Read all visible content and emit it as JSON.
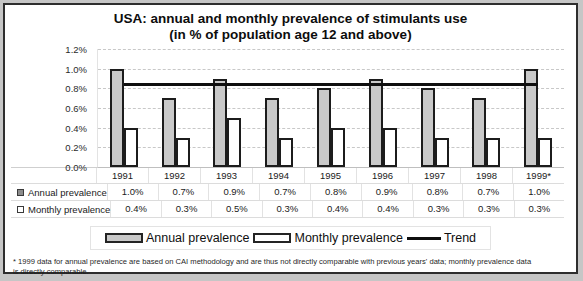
{
  "title": {
    "line1": "USA: annual and monthly prevalence of stimulants use",
    "line2": "(in % of population age 12 and above)"
  },
  "chart_data": {
    "type": "bar",
    "title": "USA: annual and monthly prevalence of stimulants use (in % of population age 12 and above)",
    "categories": [
      "1991",
      "1992",
      "1993",
      "1994",
      "1995",
      "1996",
      "1997",
      "1998",
      "1999*"
    ],
    "series": [
      {
        "name": "Annual prevalence",
        "type": "bar",
        "values": [
          1.0,
          0.7,
          0.9,
          0.7,
          0.8,
          0.9,
          0.8,
          0.7,
          1.0
        ]
      },
      {
        "name": "Monthly prevalence",
        "type": "bar",
        "values": [
          0.4,
          0.3,
          0.5,
          0.3,
          0.4,
          0.4,
          0.3,
          0.3,
          0.3
        ]
      },
      {
        "name": "Trend",
        "type": "line",
        "flat_value": 0.84
      }
    ],
    "ylim": [
      0,
      1.2
    ],
    "yticks": [
      "1.2%",
      "1.0%",
      "0.8%",
      "0.6%",
      "0.4%",
      "0.2%",
      "0.0%"
    ],
    "ytick_values": [
      1.2,
      1.0,
      0.8,
      0.6,
      0.4,
      0.2,
      0.0
    ],
    "grid": "horizontal-dashed",
    "legend_position": "bottom"
  },
  "table": {
    "years": [
      "1991",
      "1992",
      "1993",
      "1994",
      "1995",
      "1996",
      "1997",
      "1998",
      "1999*"
    ],
    "rows": [
      {
        "label": "Annual prevalence",
        "marker": "annual",
        "values": [
          "1.0%",
          "0.7%",
          "0.9%",
          "0.7%",
          "0.8%",
          "0.9%",
          "0.8%",
          "0.7%",
          "1.0%"
        ]
      },
      {
        "label": "Monthly prevalence",
        "marker": "monthly",
        "values": [
          "0.4%",
          "0.3%",
          "0.5%",
          "0.3%",
          "0.4%",
          "0.4%",
          "0.3%",
          "0.3%",
          "0.3%"
        ]
      }
    ]
  },
  "legend": {
    "items": [
      {
        "label": "Annual prevalence",
        "swatch": "annual"
      },
      {
        "label": "Monthly prevalence",
        "swatch": "monthly"
      },
      {
        "label": "Trend",
        "swatch": "line"
      }
    ]
  },
  "footnote": {
    "lines": [
      "* 1999 data for annual prevalence are based on CAI methodology and are thus not directly comparable with previous years' data; monthly prevalence data",
      "is directly comparable."
    ]
  },
  "colors": {
    "bar_annual": "#c9c9c9",
    "bar_monthly": "#ffffff",
    "bar_border": "#1c1c1c",
    "trend": "#0f0f0f",
    "marker_annual": "#8c8c8c",
    "marker_monthly": "#ffffff"
  }
}
